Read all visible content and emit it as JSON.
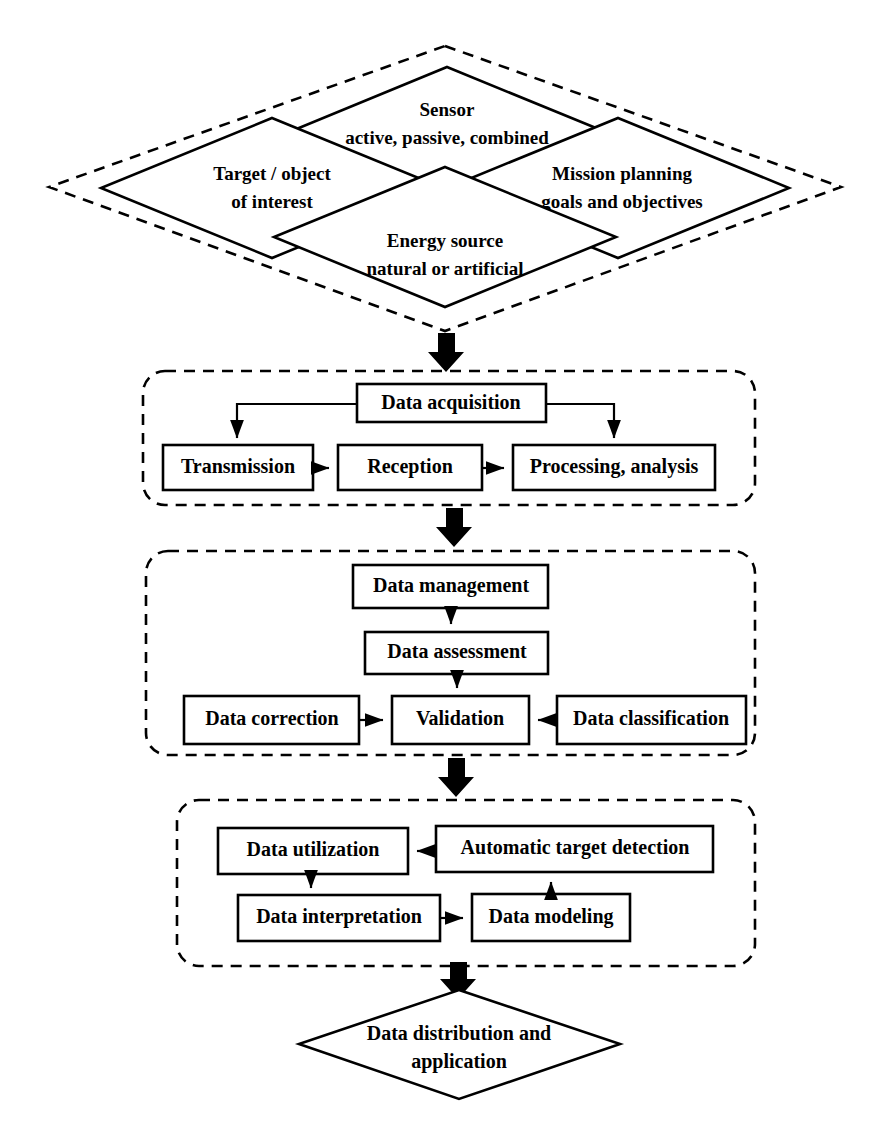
{
  "diagram": {
    "stroke_color": "#000000",
    "fill_color": "#ffffff",
    "stages": [
      {
        "id": "inputs",
        "shape": "dashed-diamond-cluster",
        "nodes": [
          {
            "id": "sensor",
            "line1": "Sensor",
            "line2": "active, passive, combined"
          },
          {
            "id": "target",
            "line1": "Target / object",
            "line2": "of interest"
          },
          {
            "id": "mission",
            "line1": "Mission planning",
            "line2": "goals and objectives"
          },
          {
            "id": "energy",
            "line1": "Energy source",
            "line2": "natural or artificial"
          }
        ]
      },
      {
        "id": "acquisition",
        "shape": "dashed-rounded-group",
        "nodes": [
          {
            "id": "data-acquisition",
            "label": "Data acquisition"
          },
          {
            "id": "transmission",
            "label": "Transmission"
          },
          {
            "id": "reception",
            "label": "Reception"
          },
          {
            "id": "processing-analysis",
            "label": "Processing, analysis"
          }
        ]
      },
      {
        "id": "management",
        "shape": "dashed-rounded-group",
        "nodes": [
          {
            "id": "data-management",
            "label": "Data management"
          },
          {
            "id": "data-assessment",
            "label": "Data assessment"
          },
          {
            "id": "data-correction",
            "label": "Data correction"
          },
          {
            "id": "validation",
            "label": "Validation"
          },
          {
            "id": "data-classification",
            "label": "Data classification"
          }
        ]
      },
      {
        "id": "exploitation",
        "shape": "dashed-rounded-group",
        "nodes": [
          {
            "id": "data-utilization",
            "label": "Data utilization"
          },
          {
            "id": "automatic-target-detection",
            "label": "Automatic target detection"
          },
          {
            "id": "data-interpretation",
            "label": "Data interpretation"
          },
          {
            "id": "data-modeling",
            "label": "Data modeling"
          }
        ]
      },
      {
        "id": "output",
        "shape": "diamond",
        "nodes": [
          {
            "id": "data-distribution",
            "line1": "Data distribution and",
            "line2": "application"
          }
        ]
      }
    ],
    "flow_arrows": [
      {
        "from": "inputs",
        "to": "acquisition",
        "style": "thick-block-down"
      },
      {
        "from": "acquisition",
        "to": "management",
        "style": "thick-block-down"
      },
      {
        "from": "management",
        "to": "exploitation",
        "style": "thick-block-down"
      },
      {
        "from": "exploitation",
        "to": "output",
        "style": "thick-block-down"
      }
    ]
  }
}
